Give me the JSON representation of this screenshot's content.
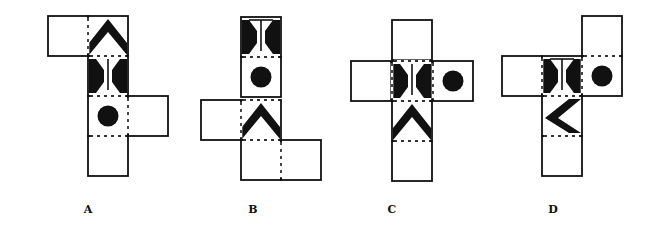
{
  "diagram": {
    "type": "cube-net-options",
    "face_size": 40,
    "options": [
      {
        "label": "A",
        "label_pos": [
          88,
          211
        ],
        "faces": [
          {
            "x": 48,
            "y": 16,
            "pattern": "blank"
          },
          {
            "x": 88,
            "y": 16,
            "pattern": "chevron",
            "dir": "up"
          },
          {
            "x": 88,
            "y": 56,
            "pattern": "hourglass",
            "dir": "vertical-line",
            "bar": "none"
          },
          {
            "x": 88,
            "y": 96,
            "pattern": "circle"
          },
          {
            "x": 128,
            "y": 96,
            "pattern": "blank"
          },
          {
            "x": 88,
            "y": 136,
            "pattern": "blank"
          }
        ],
        "folds": [
          {
            "x1": 88,
            "y1": 18,
            "x2": 88,
            "y2": 54
          },
          {
            "x1": 90,
            "y1": 56,
            "x2": 126,
            "y2": 56
          },
          {
            "x1": 90,
            "y1": 96,
            "x2": 126,
            "y2": 96
          },
          {
            "x1": 128,
            "y1": 98,
            "x2": 128,
            "y2": 134
          },
          {
            "x1": 90,
            "y1": 136,
            "x2": 126,
            "y2": 136
          }
        ]
      },
      {
        "label": "B",
        "label_pos": [
          253,
          211
        ],
        "faces": [
          {
            "x": 241,
            "y": 17,
            "pattern": "hourglass",
            "dir": "vertical-line",
            "bar": "top"
          },
          {
            "x": 241,
            "y": 57,
            "pattern": "circle"
          },
          {
            "x": 201,
            "y": 100,
            "pattern": "blank"
          },
          {
            "x": 241,
            "y": 100,
            "pattern": "chevron",
            "dir": "up"
          },
          {
            "x": 241,
            "y": 140,
            "pattern": "blank"
          },
          {
            "x": 281,
            "y": 140,
            "pattern": "blank"
          }
        ],
        "folds": [
          {
            "x1": 243,
            "y1": 57,
            "x2": 279,
            "y2": 57
          },
          {
            "x1": 243,
            "y1": 100,
            "x2": 279,
            "y2": 100
          },
          {
            "x1": 241,
            "y1": 102,
            "x2": 241,
            "y2": 138
          },
          {
            "x1": 243,
            "y1": 140,
            "x2": 279,
            "y2": 140
          },
          {
            "x1": 281,
            "y1": 142,
            "x2": 281,
            "y2": 178
          }
        ]
      },
      {
        "label": "C",
        "label_pos": [
          392,
          211
        ],
        "faces": [
          {
            "x": 392,
            "y": 20,
            "pattern": "blank"
          },
          {
            "x": 351,
            "y": 61,
            "pattern": "blank"
          },
          {
            "x": 392,
            "y": 61,
            "pattern": "hourglass",
            "dir": "vertical-line",
            "bar": "none"
          },
          {
            "x": 433,
            "y": 61,
            "pattern": "circle"
          },
          {
            "x": 392,
            "y": 101,
            "pattern": "chevron",
            "dir": "up"
          },
          {
            "x": 392,
            "y": 141,
            "pattern": "blank"
          }
        ],
        "folds": [
          {
            "x1": 394,
            "y1": 61,
            "x2": 430,
            "y2": 61
          },
          {
            "x1": 392,
            "y1": 63,
            "x2": 392,
            "y2": 99
          },
          {
            "x1": 433,
            "y1": 63,
            "x2": 433,
            "y2": 99
          },
          {
            "x1": 394,
            "y1": 101,
            "x2": 430,
            "y2": 101
          },
          {
            "x1": 394,
            "y1": 141,
            "x2": 430,
            "y2": 141
          }
        ]
      },
      {
        "label": "D",
        "label_pos": [
          553,
          211
        ],
        "faces": [
          {
            "x": 582,
            "y": 16,
            "pattern": "blank"
          },
          {
            "x": 502,
            "y": 56,
            "pattern": "blank"
          },
          {
            "x": 542,
            "y": 56,
            "pattern": "hourglass",
            "dir": "vertical-line",
            "bar": "top"
          },
          {
            "x": 582,
            "y": 56,
            "pattern": "circle"
          },
          {
            "x": 542,
            "y": 96,
            "pattern": "chevron",
            "dir": "left"
          },
          {
            "x": 542,
            "y": 136,
            "pattern": "blank"
          }
        ],
        "folds": [
          {
            "x1": 584,
            "y1": 56,
            "x2": 620,
            "y2": 56
          },
          {
            "x1": 542,
            "y1": 58,
            "x2": 542,
            "y2": 94
          },
          {
            "x1": 582,
            "y1": 58,
            "x2": 582,
            "y2": 94
          },
          {
            "x1": 544,
            "y1": 96,
            "x2": 580,
            "y2": 96
          },
          {
            "x1": 544,
            "y1": 136,
            "x2": 580,
            "y2": 136
          }
        ]
      }
    ]
  },
  "colors": {
    "ink": "#111111",
    "paper": "#ffffff",
    "fold": "#333333"
  }
}
